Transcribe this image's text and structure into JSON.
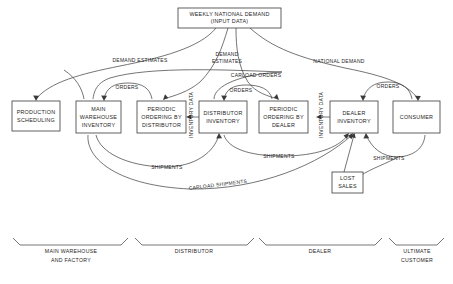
{
  "diagram": {
    "title": "WEEKLY NATIONAL DEMAND (INPUT DATA)",
    "type": "flow-diagram",
    "background_color": "#ffffff",
    "line_color": "#3a3a3a",
    "text_color": "#1d1d1d",
    "nodes": [
      {
        "id": "weekly_national_demand",
        "line1": "WEEKLY NATIONAL DEMAND",
        "line2": "(INPUT DATA)",
        "x": 178,
        "y": 8,
        "w": 103,
        "h": 20
      },
      {
        "id": "production_scheduling",
        "line1": "PRODUCTION",
        "line2": "SCHEDULING",
        "line3": "",
        "x": 12,
        "y": 101,
        "w": 48,
        "h": 30
      },
      {
        "id": "main_warehouse_inventory",
        "line1": "MAIN",
        "line2": "WAREHOUSE",
        "line3": "INVENTORY",
        "x": 76,
        "y": 101,
        "w": 45,
        "h": 32
      },
      {
        "id": "periodic_ordering_by_distributor",
        "line1": "PERIODIC",
        "line2": "ORDERING BY",
        "line3": "DISTRIBUTOR",
        "x": 137,
        "y": 101,
        "w": 49,
        "h": 32
      },
      {
        "id": "distributor_inventory",
        "line1": "DISTRIBUTOR",
        "line2": "INVENTORY",
        "line3": "",
        "x": 199,
        "y": 101,
        "w": 48,
        "h": 32
      },
      {
        "id": "periodic_ordering_by_dealer",
        "line1": "PERIODIC",
        "line2": "ORDERING BY",
        "line3": "DEALER",
        "x": 259,
        "y": 101,
        "w": 49,
        "h": 32
      },
      {
        "id": "dealer_inventory",
        "line1": "DEALER",
        "line2": "INVENTORY",
        "line3": "",
        "x": 330,
        "y": 101,
        "w": 48,
        "h": 32
      },
      {
        "id": "consumer",
        "line1": "CONSUMER",
        "line2": "",
        "line3": "",
        "x": 393,
        "y": 101,
        "w": 47,
        "h": 32
      },
      {
        "id": "lost_sales",
        "line1": "LOST",
        "line2": "SALES",
        "line3": "",
        "x": 332,
        "y": 172,
        "w": 31,
        "h": 21
      }
    ],
    "edge_labels": [
      {
        "id": "demand_estimates_left",
        "text": "DEMAND ESTIMATES",
        "x": 140,
        "y": 61
      },
      {
        "id": "demand_estimates_center",
        "text": "DEMAND",
        "x": 227,
        "y": 55
      },
      {
        "id": "estimates_center2",
        "text": "ESTIMATES",
        "x": 227,
        "y": 61
      },
      {
        "id": "national_demand",
        "text": "NATIONAL DEMAND",
        "x": 339,
        "y": 62
      },
      {
        "id": "carload_orders",
        "text": "CARLOAD ORDERS",
        "x": 256,
        "y": 76
      },
      {
        "id": "orders_1",
        "text": "ORDERS",
        "x": 127,
        "y": 88
      },
      {
        "id": "orders_2",
        "text": "ORDERS",
        "x": 241,
        "y": 91
      },
      {
        "id": "orders_3",
        "text": "ORDERS",
        "x": 388,
        "y": 87
      },
      {
        "id": "inventory_data_1",
        "text": "INVENTORY DATA",
        "x": 192,
        "y": 115,
        "rotated": true
      },
      {
        "id": "inventory_data_2",
        "text": "INVENTORY DATA",
        "x": 322,
        "y": 115,
        "rotated": true
      },
      {
        "id": "shipments_1",
        "text": "SHIPMENTS",
        "x": 167,
        "y": 168
      },
      {
        "id": "shipments_2",
        "text": "SHIPMENTS",
        "x": 279,
        "y": 157
      },
      {
        "id": "shipments_3",
        "text": "SHIPMENTS",
        "x": 389,
        "y": 159
      },
      {
        "id": "carload_shipments",
        "text": "CARLOAD SHIPMENTS",
        "x": 218,
        "y": 185
      }
    ],
    "groups": [
      {
        "id": "group_main_warehouse",
        "line1": "MAIN WAREHOUSE",
        "line2": "AND FACTORY",
        "x1": 13,
        "x2": 128,
        "label_x": 71,
        "label_y": 252
      },
      {
        "id": "group_distributor",
        "line1": "DISTRIBUTOR",
        "line2": "",
        "x1": 135,
        "x2": 254,
        "label_x": 194,
        "label_y": 252
      },
      {
        "id": "group_dealer",
        "line1": "DEALER",
        "line2": "",
        "x1": 259,
        "x2": 382,
        "label_x": 320,
        "label_y": 252
      },
      {
        "id": "group_ultimate_customer",
        "line1": "ULTIMATE",
        "line2": "CUSTOMER",
        "x1": 389,
        "x2": 444,
        "label_x": 417,
        "label_y": 252
      }
    ]
  }
}
